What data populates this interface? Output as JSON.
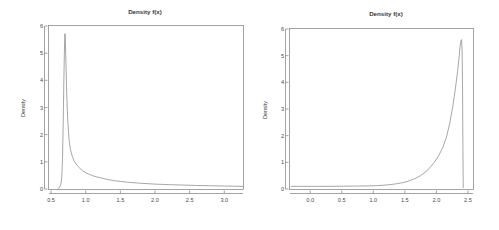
{
  "figure": {
    "background": "#ffffff",
    "axis_color": "#7c7c7c",
    "curve_color": "#8a8a8a",
    "text_color": "#3a3a3a"
  },
  "panels": [
    {
      "name": "left-density-plot",
      "title": "Density f(x)",
      "ylabel": "Density",
      "xlabel": "",
      "xticks": [
        "0.5",
        "1.0",
        "1.5",
        "2.0",
        "2.5",
        "3.0"
      ],
      "yticks": [
        "0",
        "1",
        "2",
        "3",
        "4",
        "5",
        "6"
      ]
    },
    {
      "name": "right-density-plot",
      "title": "Density f(x)",
      "ylabel": "Density",
      "xlabel": "",
      "xticks": [
        "0.0",
        "0.5",
        "1.0",
        "1.5",
        "2.0",
        "2.5"
      ],
      "yticks": [
        "0",
        "1",
        "2",
        "3",
        "4",
        "5",
        "6"
      ]
    }
  ],
  "chart_data": [
    {
      "type": "line",
      "title": "Density f(x)",
      "xlabel": "",
      "ylabel": "Density",
      "xlim": [
        0.47,
        3.27
      ],
      "ylim": [
        0,
        6
      ],
      "xticks": [
        0.5,
        1.0,
        1.5,
        2.0,
        2.5,
        3.0
      ],
      "yticks": [
        0,
        1,
        2,
        3,
        4,
        5,
        6
      ],
      "grid": false,
      "legend": "none",
      "description": "Right-skewed unimodal density with a sharp spike near x=0.70 and a long decaying right tail.",
      "series": [
        {
          "name": "density",
          "x": [
            0.6,
            0.62,
            0.64,
            0.655,
            0.665,
            0.675,
            0.685,
            0.695,
            0.7,
            0.705,
            0.715,
            0.725,
            0.74,
            0.76,
            0.78,
            0.8,
            0.83,
            0.86,
            0.9,
            0.95,
            1.0,
            1.05,
            1.1,
            1.15,
            1.2,
            1.3,
            1.4,
            1.5,
            1.6,
            1.7,
            1.8,
            1.9,
            2.0,
            2.2,
            2.4,
            2.6,
            2.8,
            3.0,
            3.2,
            3.27
          ],
          "y": [
            0.02,
            0.05,
            0.16,
            0.45,
            1.1,
            2.4,
            4.1,
            5.4,
            5.72,
            5.55,
            4.6,
            3.55,
            2.55,
            1.8,
            1.45,
            1.25,
            1.05,
            0.92,
            0.8,
            0.68,
            0.6,
            0.54,
            0.49,
            0.45,
            0.42,
            0.36,
            0.31,
            0.28,
            0.25,
            0.23,
            0.21,
            0.195,
            0.18,
            0.16,
            0.145,
            0.13,
            0.12,
            0.11,
            0.1,
            0.095
          ]
        }
      ]
    },
    {
      "type": "line",
      "title": "Density f(x)",
      "xlabel": "",
      "ylabel": "Density",
      "xlim": [
        -0.32,
        2.58
      ],
      "ylim": [
        0,
        6
      ],
      "xticks": [
        0.0,
        0.5,
        1.0,
        1.5,
        2.0,
        2.5
      ],
      "yticks": [
        0,
        1,
        2,
        3,
        4,
        5,
        6
      ],
      "grid": false,
      "legend": "none",
      "description": "Left-skewed (mirrored) unimodal density, near zero across most of the range, rising steeply to a sharp spike near x=2.40 then dropping vertically to zero.",
      "series": [
        {
          "name": "density",
          "x": [
            -0.3,
            -0.1,
            0.1,
            0.3,
            0.5,
            0.7,
            0.9,
            1.05,
            1.15,
            1.25,
            1.35,
            1.45,
            1.55,
            1.65,
            1.75,
            1.85,
            1.95,
            2.03,
            2.1,
            2.16,
            2.21,
            2.26,
            2.3,
            2.335,
            2.36,
            2.375,
            2.39,
            2.4,
            2.408,
            2.415,
            2.42,
            2.425
          ],
          "y": [
            0.1,
            0.1,
            0.1,
            0.1,
            0.105,
            0.11,
            0.115,
            0.125,
            0.14,
            0.16,
            0.19,
            0.23,
            0.29,
            0.38,
            0.5,
            0.68,
            0.95,
            1.22,
            1.55,
            1.95,
            2.45,
            3.1,
            3.75,
            4.4,
            4.95,
            5.35,
            5.58,
            5.6,
            5.1,
            3.6,
            1.6,
            0.05
          ]
        }
      ]
    }
  ]
}
